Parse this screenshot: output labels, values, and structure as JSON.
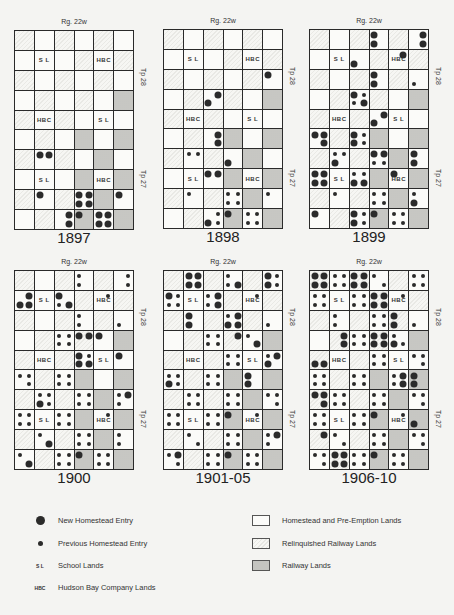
{
  "base_layout": [
    [
      "R",
      "W",
      "R",
      "W",
      "R",
      "W"
    ],
    [
      "W",
      "SL",
      "W",
      "R",
      "HBC",
      "R"
    ],
    [
      "R",
      "W",
      "R",
      "W",
      "R",
      "W"
    ],
    [
      "W",
      "R",
      "W",
      "R",
      "W",
      "D"
    ],
    [
      "R",
      "HBC",
      "R",
      "W",
      "SL",
      "W"
    ],
    [
      "W",
      "R",
      "W",
      "D",
      "W",
      "D"
    ],
    [
      "R",
      "W",
      "R",
      "W",
      "D",
      "W"
    ],
    [
      "W",
      "SL",
      "W",
      "D",
      "HBC",
      "D"
    ],
    [
      "R",
      "W",
      "R",
      "W",
      "D",
      "W"
    ],
    [
      "W",
      "R",
      "W",
      "D",
      "W",
      "D"
    ]
  ],
  "labels": {
    "range": "Rg. 22w",
    "township_upper": "Tp 28",
    "township_lower": "Tp 27",
    "school": "S L",
    "hbc": "HBC"
  },
  "panels": [
    {
      "year": "1897",
      "x": 14,
      "y": 30,
      "dots": [
        [
          "....",
          "....",
          "....",
          "....",
          "....",
          "...."
        ],
        [
          "....",
          "....",
          "....",
          "....",
          "....",
          "...."
        ],
        [
          "....",
          "....",
          "....",
          "....",
          "....",
          "...."
        ],
        [
          "....",
          "....",
          "....",
          "....",
          "....",
          "...."
        ],
        [
          "....",
          "....",
          "....",
          "....",
          "....",
          "...."
        ],
        [
          "....",
          "....",
          "....",
          "....",
          "....",
          "...."
        ],
        [
          "....",
          "LL..",
          "....",
          "....",
          "....",
          "...."
        ],
        [
          "....",
          "....",
          "....",
          "....",
          "....",
          "...."
        ],
        [
          "....",
          "L...",
          "....",
          "LLLL",
          "....",
          "L..."
        ],
        [
          "....",
          "....",
          ".L.L",
          "L...",
          "LLLL",
          "...."
        ]
      ]
    },
    {
      "year": "1898",
      "x": 163,
      "y": 29,
      "dots": [
        [
          "....",
          "....",
          "....",
          "....",
          "....",
          "...."
        ],
        [
          "....",
          "....",
          "....",
          "....",
          "....",
          "...."
        ],
        [
          "....",
          "....",
          "....",
          "....",
          "....",
          "L..."
        ],
        [
          "....",
          "....",
          ".LL.",
          "....",
          "....",
          "...."
        ],
        [
          "....",
          "....",
          "....",
          "....",
          "....",
          "...."
        ],
        [
          "....",
          "....",
          ".L.L",
          "....",
          "....",
          "...."
        ],
        [
          "....",
          "ss..",
          "....",
          "..L.",
          "....",
          "...."
        ],
        [
          "....",
          "....",
          "LL..",
          "....",
          "....",
          "...."
        ],
        [
          "....",
          "s...",
          "....",
          "ssss",
          "....",
          "s..."
        ],
        [
          "....",
          "....",
          ".sLs",
          "L...",
          "ssss",
          "...."
        ]
      ]
    },
    {
      "year": "1899",
      "x": 309,
      "y": 29,
      "dots": [
        [
          "....",
          "....",
          "....",
          "L.L.",
          "....",
          ".L.L"
        ],
        [
          "....",
          "....",
          "..L.",
          "....",
          ".L..",
          "...."
        ],
        [
          "....",
          "....",
          "....",
          "L.L.",
          "....",
          "..s."
        ],
        [
          "....",
          "....",
          "LssL",
          "....",
          "....",
          "...."
        ],
        [
          "....",
          "....",
          "....",
          ".LL.",
          "....",
          "...."
        ],
        [
          "LL.L",
          "....",
          "LsLs",
          "....",
          "....",
          "...."
        ],
        [
          "....",
          "ssL.",
          "....",
          "LLss",
          "....",
          "L.L."
        ],
        [
          "LLLL",
          "....",
          "ssLL",
          "....",
          "L...",
          "...."
        ],
        [
          "....",
          "s...",
          "....",
          "ssss",
          "....",
          "s.L."
        ],
        [
          "L...",
          "....",
          "LsLs",
          "L...",
          "ssss",
          "...."
        ]
      ]
    },
    {
      "year": "1900",
      "x": 14,
      "y": 270,
      "dots": [
        [
          "....",
          "....",
          "....",
          "s.s.",
          "....",
          ".s.s"
        ],
        [
          ".LLL",
          "....",
          "L.sL",
          "....",
          ".s..",
          "...."
        ],
        [
          "....",
          "....",
          "....",
          "s.s.",
          "....",
          "..s."
        ],
        [
          "....",
          "....",
          "ssss",
          "LL..",
          "L...",
          "...."
        ],
        [
          "....",
          "....",
          "....",
          "LsLL",
          "....",
          "L..."
        ],
        [
          "ss.s",
          "....",
          "ssss",
          "....",
          "....",
          "...."
        ],
        [
          "....",
          "ssLs",
          "....",
          "ssss",
          "....",
          "sLs."
        ],
        [
          "ssss",
          "....",
          "ssss",
          "....",
          ".s..",
          "...."
        ],
        [
          "....",
          "s..L",
          "....",
          "ssss",
          "....",
          "s.s."
        ],
        [
          "s..L",
          "....",
          "ssss",
          "L...",
          "ssss",
          "...."
        ]
      ]
    },
    {
      "year": "1901-05",
      "x": 163,
      "y": 270,
      "dots": [
        [
          "....",
          "LLLL",
          "....",
          "s.sL",
          "....",
          "LsLs"
        ],
        [
          "Lsss",
          "....",
          "sLsL",
          "....",
          ".s..",
          "...."
        ],
        [
          "....",
          "L.L.",
          "....",
          "sLLL",
          "....",
          "..s."
        ],
        [
          "....",
          "....",
          "ssss",
          ".L..",
          "s..L",
          "...."
        ],
        [
          "....",
          "....",
          "....",
          "ssss",
          "....",
          "sLL."
        ],
        [
          "ssLs",
          "....",
          "ssss",
          "....",
          "L.L.",
          "...."
        ],
        [
          "....",
          "ssss",
          "....",
          "ssss",
          "....",
          "ss.s"
        ],
        [
          "ssss",
          "....",
          "ssss",
          "L...",
          ".s..",
          "...."
        ],
        [
          "....",
          "s..s",
          "....",
          "ssss",
          "....",
          "sLs."
        ],
        [
          "sL.s",
          "....",
          "ssss",
          "L...",
          "ssss",
          "...."
        ]
      ]
    },
    {
      "year": "1906-10",
      "x": 309,
      "y": 270,
      "dots": [
        [
          "LLLL",
          "ssss",
          "LLLL",
          "s..s",
          "....",
          "ssss"
        ],
        [
          "ssss",
          "....",
          "ssss",
          "LLLL",
          ".s..",
          "...."
        ],
        [
          "....",
          "s.s.",
          "....",
          "ssss",
          "L.L.",
          "..s."
        ],
        [
          "....",
          ".L.L",
          "ssss",
          "LLLL",
          "s.Ls",
          "...."
        ],
        [
          "..LL",
          "....",
          "....",
          "ssss",
          "....",
          "ss.s"
        ],
        [
          "ssss",
          "....",
          "ssss",
          "....",
          "sLsL",
          "L.L."
        ],
        [
          "LL.L",
          "ssss",
          "....",
          "ssss",
          "....",
          "ss.s"
        ],
        [
          "ssss",
          "....",
          "ssss",
          "L...",
          ".s..",
          "..L."
        ],
        [
          ".L..",
          "s..s",
          "....",
          "ssss",
          "....",
          "ss.s"
        ],
        [
          "ss.s",
          "LLLL",
          "ssss",
          "L...",
          "ssss",
          "...."
        ]
      ]
    }
  ],
  "legend": {
    "left": [
      {
        "symbol": "large-dot",
        "label": "New Homestead Entry"
      },
      {
        "symbol": "small-dot",
        "label": "Previous Homestead Entry"
      },
      {
        "symbol": "S L",
        "label": "School Lands"
      },
      {
        "symbol": "HBC",
        "label": "Hudson Bay Company Lands"
      }
    ],
    "right": [
      {
        "swatch": "W",
        "label": "Homestead and Pre-Emption Lands"
      },
      {
        "swatch": "R",
        "label": "Relinquished Railway Lands"
      },
      {
        "swatch": "D",
        "label": "Railway Lands"
      }
    ]
  }
}
